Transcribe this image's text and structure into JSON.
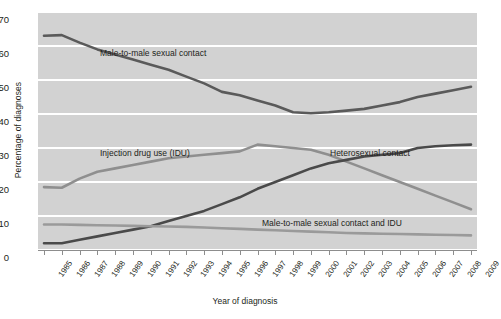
{
  "chart_data": {
    "type": "line",
    "title": "",
    "xlabel": "Year of diagnosis",
    "ylabel": "Percentage of diagnoses",
    "ylim": [
      0,
      70
    ],
    "yticks": [
      0,
      10,
      20,
      30,
      40,
      50,
      60,
      70
    ],
    "grid": true,
    "legend_position": "inline-annotations",
    "x": [
      1985,
      1986,
      1987,
      1988,
      1989,
      1990,
      1991,
      1992,
      1993,
      1994,
      1995,
      1996,
      1997,
      1998,
      1999,
      2000,
      2001,
      2002,
      2003,
      2004,
      2005,
      2006,
      2007,
      2008,
      2009
    ],
    "categories": [
      "1985",
      "1986",
      "1987",
      "1988",
      "1989",
      "1990",
      "1991",
      "1992",
      "1993",
      "1994",
      "1995",
      "1996",
      "1997",
      "1998",
      "1999",
      "2000",
      "2001",
      "2002",
      "2003",
      "2004",
      "2005",
      "2006",
      "2007",
      "2008",
      "2009"
    ],
    "series": [
      {
        "name": "Male-to-male sexual contact",
        "color": "#5a5a5a",
        "values": [
          63.0,
          63.2,
          61.0,
          59.0,
          57.5,
          56.0,
          54.5,
          53.0,
          51.0,
          49.0,
          46.5,
          45.5,
          44.0,
          42.5,
          40.5,
          40.2,
          40.5,
          41.0,
          41.5,
          42.5,
          43.5,
          45.0,
          46.0,
          47.0,
          48.0
        ]
      },
      {
        "name": "Injection drug use (IDU)",
        "color": "#8f8f8f",
        "values": [
          18.5,
          18.3,
          21.0,
          23.0,
          24.0,
          25.0,
          26.0,
          27.0,
          27.5,
          28.0,
          28.5,
          29.0,
          31.0,
          30.5,
          30.0,
          29.5,
          28.0,
          26.0,
          24.0,
          22.0,
          20.0,
          18.0,
          16.0,
          14.0,
          12.0
        ]
      },
      {
        "name": "Heterosexual contact",
        "color": "#4a4a4a",
        "values": [
          2.0,
          2.0,
          3.0,
          4.0,
          5.0,
          6.0,
          7.0,
          8.5,
          10.0,
          11.5,
          13.5,
          15.5,
          18.0,
          20.0,
          22.0,
          24.0,
          25.5,
          26.5,
          27.5,
          28.0,
          28.5,
          30.0,
          30.5,
          30.8,
          31.0
        ]
      },
      {
        "name": "Male-to-male sexual contact and IDU",
        "color": "#9a9a9a",
        "values": [
          7.5,
          7.5,
          7.4,
          7.3,
          7.2,
          7.1,
          7.0,
          6.9,
          6.8,
          6.6,
          6.4,
          6.2,
          6.0,
          5.8,
          5.6,
          5.4,
          5.2,
          5.0,
          4.9,
          4.8,
          4.7,
          4.6,
          4.5,
          4.4,
          4.3
        ]
      }
    ],
    "annotations": [
      {
        "text": "Male-to-male sexual contact",
        "x_px": 100,
        "y_px": 48
      },
      {
        "text": "Injection drug use (IDU)",
        "x_px": 100,
        "y_px": 148
      },
      {
        "text": "Heterosexual contact",
        "x_px": 330,
        "y_px": 148
      },
      {
        "text": "Male-to-male sexual contact and IDU",
        "x_px": 262,
        "y_px": 218
      }
    ],
    "colors": {
      "plot_background": "#d2d2d2",
      "gridline": "#ffffff",
      "axis": "#8d8d8d",
      "text": "#231f20"
    }
  }
}
